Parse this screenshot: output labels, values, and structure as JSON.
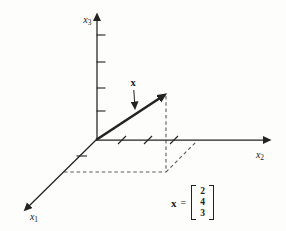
{
  "figure": {
    "background": "#fdfdfc",
    "ink": "#222222",
    "dash_color": "#5c5c5c",
    "axis_labels": {
      "x1": {
        "base": "x",
        "sub": "1"
      },
      "x2": {
        "base": "x",
        "sub": "2"
      },
      "x3": {
        "base": "x",
        "sub": "3"
      }
    },
    "vector": {
      "label": "x",
      "components": [
        2,
        4,
        3
      ]
    },
    "equation": {
      "lhs": "x",
      "relation": "=",
      "entries": [
        "2",
        "4",
        "3"
      ]
    }
  }
}
